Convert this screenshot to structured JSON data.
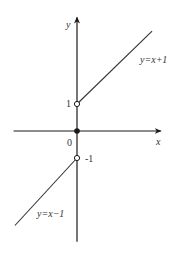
{
  "chart_data": {
    "type": "line",
    "title": "",
    "xlabel": "x",
    "ylabel": "y",
    "origin_label": "0",
    "xlim": [
      -2.35,
      3.1
    ],
    "ylim": [
      -4.1,
      4.2
    ],
    "grid": false,
    "colors": {
      "axis": "#1a1a1a",
      "line": "#333333",
      "text": "#333333"
    },
    "tick_labels": [
      {
        "axis": "y",
        "value": 1,
        "text": "1"
      },
      {
        "axis": "y",
        "value": -1,
        "text": "-1"
      }
    ],
    "series": [
      {
        "name": "y=x+1",
        "label": "y=x+1",
        "points": [
          [
            0,
            1
          ],
          [
            2.78,
            3.7
          ]
        ],
        "start_marker": "open-circle"
      },
      {
        "name": "y=x-1",
        "label": "y=x−1",
        "points": [
          [
            0,
            -1
          ],
          [
            -2.3,
            -3.5
          ]
        ],
        "start_marker": "open-circle"
      }
    ],
    "special_points": [
      {
        "x": 0,
        "y": 0,
        "marker": "filled-circle"
      }
    ]
  }
}
